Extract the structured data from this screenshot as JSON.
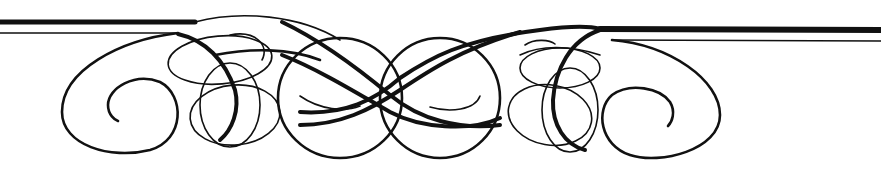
{
  "ornament": {
    "description": "Calligraphic flourish divider with horizontal rules",
    "ink_color": "#111111",
    "background_color": "#ffffff",
    "elements": [
      "left-double-rule",
      "right-double-rule",
      "left-spiral",
      "right-spiral",
      "center-interlace"
    ]
  }
}
